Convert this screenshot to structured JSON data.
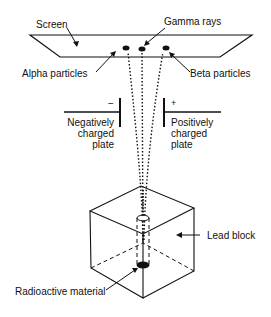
{
  "labels": {
    "screen": "Screen",
    "gamma_rays": "Gamma rays",
    "alpha_particles": "Alpha particles",
    "beta_particles": "Beta particles",
    "negative_sign": "−",
    "positive_sign": "+",
    "negative_plate": [
      "Negatively",
      "charged",
      "plate"
    ],
    "positive_plate": [
      "Positively",
      "charged",
      "plate"
    ],
    "lead_block": "Lead block",
    "radioactive_material": "Radioactive material"
  },
  "colors": {
    "ink": "#111111",
    "background": "#ffffff"
  }
}
